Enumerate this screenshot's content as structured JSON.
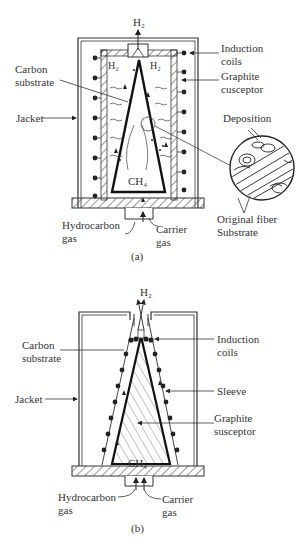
{
  "figure_a": {
    "caption": "(a)",
    "labels": {
      "h2_top": "H₂",
      "h2_left": "H₂",
      "h2_right": "H₂",
      "ch4": "CH₄",
      "induction_coils_1": "Induction",
      "induction_coils_2": "coils",
      "graphite_1": "Graphite",
      "graphite_2": "cusceptor",
      "carbon_1": "Carbon",
      "carbon_2": "substrate",
      "jacket": "Jacket",
      "deposition": "Deposition",
      "original_1": "Original fiber",
      "original_2": "Substrate",
      "hydrocarbon_1": "Hydrocarbon",
      "hydrocarbon_2": "gas",
      "carrier_1": "Carrier",
      "carrier_2": "gas"
    }
  },
  "figure_b": {
    "caption": "(b)",
    "labels": {
      "h2_top": "H₂",
      "ch4": "CH₄",
      "induction_coils_1": "Induction",
      "induction_coils_2": "coils",
      "carbon_1": "Carbon",
      "carbon_2": "substrate",
      "jacket": "Jacket",
      "sleeve": "Sleeve",
      "graphite_1": "Graphite",
      "graphite_2": "susceptor",
      "hydrocarbon_1": "Hydrocarbon",
      "hydrocarbon_2": "gas",
      "carrier_1": "Carrier",
      "carrier_2": "gas"
    }
  }
}
